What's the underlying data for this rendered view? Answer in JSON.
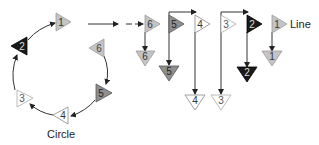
{
  "colors": {
    "light": "#c4c4c4",
    "black": "#1a1a1a",
    "white": "#ffffff",
    "dark_gray": "#8f8f8f",
    "line": "#333333"
  },
  "circle": {
    "label": "Circle",
    "nodes": [
      {
        "id": "1",
        "label": "1",
        "shade": "light",
        "direction": "right"
      },
      {
        "id": "2",
        "label": "2",
        "shade": "black",
        "direction": "left"
      },
      {
        "id": "3",
        "label": "3",
        "shade": "white",
        "direction": "right"
      },
      {
        "id": "4",
        "label": "4",
        "shade": "white",
        "direction": "left"
      },
      {
        "id": "5",
        "label": "5",
        "shade": "dark_gray",
        "direction": "right"
      },
      {
        "id": "6",
        "label": "6",
        "shade": "light",
        "direction": "left"
      }
    ]
  },
  "line": {
    "label": "Line",
    "top_nodes": [
      {
        "label": "6",
        "shade": "light"
      },
      {
        "label": "5",
        "shade": "dark_gray"
      },
      {
        "label": "4",
        "shade": "white"
      },
      {
        "label": "3",
        "shade": "white"
      },
      {
        "label": "2",
        "shade": "black"
      },
      {
        "label": "1",
        "shade": "light"
      }
    ],
    "bottom_nodes": [
      {
        "label": "6",
        "shade": "light"
      },
      {
        "label": "5",
        "shade": "dark_gray"
      },
      {
        "label": "4",
        "shade": "white"
      },
      {
        "label": "3",
        "shade": "white"
      },
      {
        "label": "2",
        "shade": "black"
      },
      {
        "label": "1",
        "shade": "light"
      }
    ]
  }
}
